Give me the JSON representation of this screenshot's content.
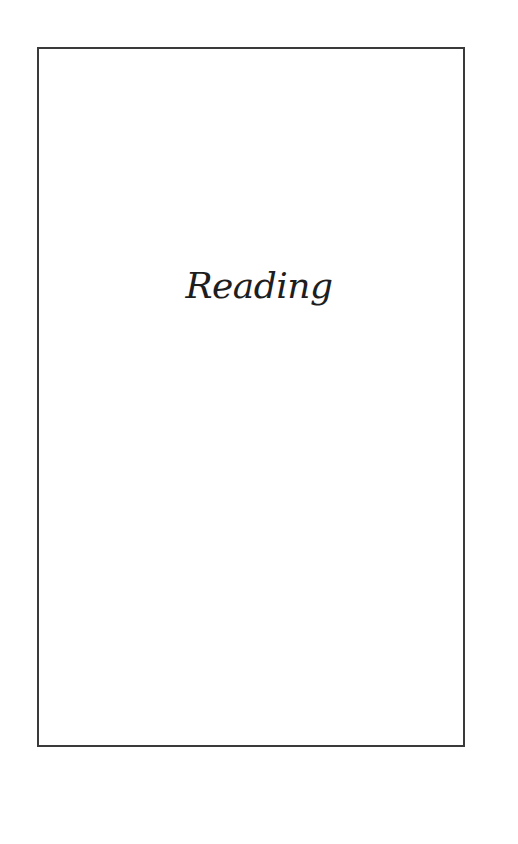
{
  "page": {
    "title": "Reading"
  },
  "colors": {
    "background": "#ffffff",
    "frame_border": "#3a3a3a",
    "text": "#1e1e1e"
  }
}
